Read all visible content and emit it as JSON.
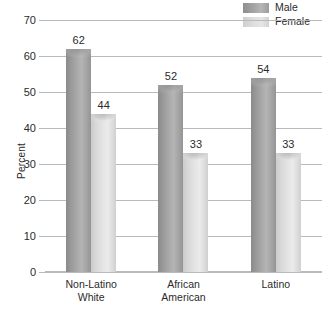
{
  "chart_data": {
    "type": "bar",
    "title": "",
    "xlabel": "",
    "ylabel": "Percent",
    "ylim": [
      0,
      70
    ],
    "ytick_step": 10,
    "yticks": [
      0,
      10,
      20,
      30,
      40,
      50,
      60,
      70
    ],
    "grid": true,
    "legend_position": "top-right",
    "categories": [
      "Non-Latino White",
      "African American",
      "Latino"
    ],
    "category_lines": [
      [
        "Non-Latino",
        "White"
      ],
      [
        "African",
        "American"
      ],
      [
        "Latino"
      ]
    ],
    "series": [
      {
        "name": "Male",
        "color": "#a3a3a3",
        "values": [
          62,
          52,
          54
        ]
      },
      {
        "name": "Female",
        "color": "#dedede",
        "values": [
          44,
          33,
          33
        ]
      }
    ]
  },
  "legend": {
    "items": [
      {
        "label": "Male",
        "swatch": "male-swatch-icon"
      },
      {
        "label": "Female",
        "swatch": "female-swatch-icon"
      }
    ]
  },
  "axis": {
    "y_title": "Percent",
    "y_tick_labels": [
      "70",
      "60",
      "50",
      "40",
      "30",
      "20",
      "10",
      "0"
    ]
  },
  "colors": {
    "male": "#a3a3a3",
    "female": "#dedede",
    "gridline": "#b9babb",
    "text": "#2b2b2b",
    "background": "#ffffff"
  }
}
